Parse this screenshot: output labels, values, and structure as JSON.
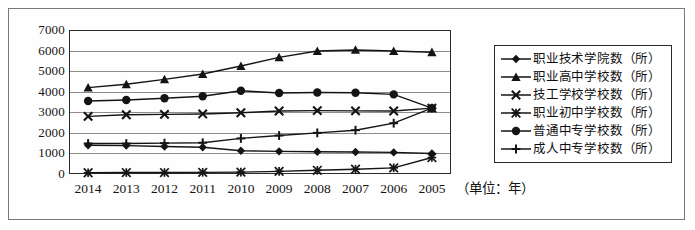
{
  "chart_data": {
    "type": "line",
    "title": "",
    "subtitle": "",
    "xlabel": "（单位：年）",
    "ylabel": "",
    "x": [
      "2014",
      "2013",
      "2012",
      "2011",
      "2010",
      "2009",
      "2008",
      "2007",
      "2006",
      "2005"
    ],
    "categories": [
      "2014",
      "2013",
      "2012",
      "2011",
      "2010",
      "2009",
      "2008",
      "2007",
      "2006",
      "2005"
    ],
    "ylim": [
      0,
      7000
    ],
    "ytick_labels": [
      "7000",
      "6000",
      "5000",
      "4000",
      "3000",
      "2000",
      "1000",
      "0"
    ],
    "yticks": [
      7000,
      6000,
      5000,
      4000,
      3000,
      2000,
      1000,
      0
    ],
    "grid": true,
    "legend_position": "right",
    "series": [
      {
        "name": "职业技术学院数（所）",
        "marker": "diamond",
        "values": [
          1400,
          1380,
          1340,
          1300,
          1130,
          1100,
          1080,
          1070,
          1050,
          1000
        ]
      },
      {
        "name": "职业高中学校数（所）",
        "marker": "triangle",
        "values": [
          4200,
          4360,
          4600,
          4860,
          5250,
          5670,
          5980,
          6030,
          5980,
          5920
        ]
      },
      {
        "name": "技工学校学校数（所）",
        "marker": "cross",
        "values": [
          2800,
          2880,
          2900,
          2920,
          2980,
          3060,
          3080,
          3070,
          3060,
          3200
        ]
      },
      {
        "name": "职业初中学校数（所）",
        "marker": "asterisk",
        "values": [
          60,
          70,
          70,
          80,
          90,
          130,
          180,
          230,
          300,
          800
        ]
      },
      {
        "name": "普通中专学校数（所）",
        "marker": "circle",
        "values": [
          3550,
          3600,
          3680,
          3780,
          4050,
          3940,
          3960,
          3950,
          3870,
          3200
        ]
      },
      {
        "name": "成人中专学校数（所）",
        "marker": "plus",
        "values": [
          1480,
          1480,
          1500,
          1520,
          1730,
          1870,
          2000,
          2130,
          2470,
          3200
        ]
      }
    ]
  },
  "legend": {
    "items": [
      "职业技术学院数（所）",
      "职业高中学校数（所）",
      "技工学校学校数（所）",
      "职业初中学校数（所）",
      "普通中专学校数（所）",
      "成人中专学校数（所）"
    ]
  },
  "axis": {
    "unit_label": "（单位：年）"
  }
}
